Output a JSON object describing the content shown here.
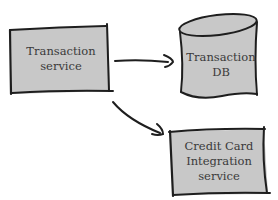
{
  "diagram": {
    "nodes": [
      {
        "id": "transaction-service",
        "shape": "rectangle",
        "lines": [
          "Transaction",
          "service"
        ]
      },
      {
        "id": "transaction-db",
        "shape": "cylinder",
        "lines": [
          "Transaction",
          "DB"
        ]
      },
      {
        "id": "credit-card-service",
        "shape": "rectangle",
        "lines": [
          "Credit Card",
          "Integration",
          "service"
        ]
      }
    ],
    "edges": [
      {
        "from": "transaction-service",
        "to": "transaction-db"
      },
      {
        "from": "transaction-service",
        "to": "credit-card-service"
      }
    ],
    "colors": {
      "fill": "#c8c8c8",
      "stroke": "#1e1e1e",
      "text": "#3a3a3a",
      "background": "#ffffff"
    }
  }
}
